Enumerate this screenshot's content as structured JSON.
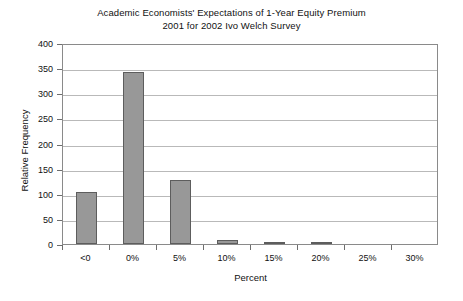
{
  "chart_data": {
    "type": "bar",
    "title": "Academic Economists' Expectations of 1-Year Equity Premium 2001 for 2002 Ivo Welch Survey",
    "title_lines": [
      "Academic Economists' Expectations of 1-Year Equity Premium",
      "2001 for 2002 Ivo Welch Survey"
    ],
    "xlabel": "Percent",
    "ylabel": "Relative Frequency",
    "categories": [
      "<0",
      "0%",
      "5%",
      "10%",
      "15%",
      "20%",
      "25%",
      "30%"
    ],
    "values": [
      103,
      342,
      128,
      8,
      4,
      3,
      0,
      0
    ],
    "ylim": [
      0,
      400
    ],
    "ytick_values": [
      0,
      50,
      100,
      150,
      200,
      250,
      300,
      350,
      400
    ],
    "ytick_labels": [
      "0",
      "50",
      "100",
      "150",
      "200",
      "250",
      "300",
      "350",
      "400"
    ],
    "grid": "horizontal",
    "legend": "none",
    "bar_color": "#989898",
    "bar_border_color": "#5d5d5d",
    "gridline_color": "#b9b9b9",
    "axis_color": "#6e6e6e",
    "background_color": "#ffffff"
  }
}
